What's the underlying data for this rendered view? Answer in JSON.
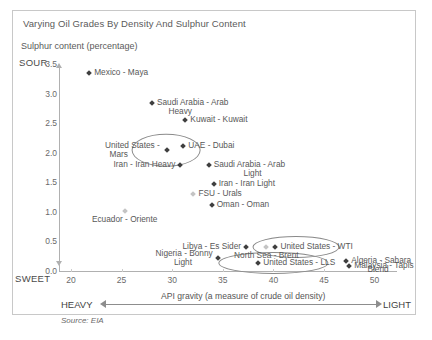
{
  "chart_data": {
    "type": "scatter",
    "title": "Varying Oil Grades By Density And Sulphur Content",
    "ylabel": "Sulphur content (percentage)",
    "xlabel": "API gravity (a measure of crude oil density)",
    "xlim": [
      20,
      50
    ],
    "ylim": [
      0.0,
      3.5
    ],
    "xticks": [
      "20",
      "25",
      "30",
      "35",
      "40",
      "45",
      "50"
    ],
    "yticks": [
      "0.0",
      "0.5",
      "1.0",
      "1.5",
      "2.0",
      "2.5",
      "3.0",
      "3.5"
    ],
    "grid": false,
    "legend": "none",
    "axis_end_labels": {
      "y_top": "SOUR",
      "y_bottom": "SWEET",
      "x_left": "HEAVY",
      "x_right": "LIGHT"
    },
    "source": "Source: EIA",
    "marker_color": "#3f3f3f",
    "highlight_color": "#8a8a8a",
    "points": [
      {
        "name": "Mexico - Maya",
        "x": 21.8,
        "y": 3.35,
        "label_pos": "right",
        "faint": false,
        "highlighted": false
      },
      {
        "name": "Saudi Arabia - Arab\n     Heavy",
        "x": 28.0,
        "y": 2.85,
        "label_pos": "right",
        "faint": false,
        "highlighted": false
      },
      {
        "name": "Kuwait - Kuwait",
        "x": 31.3,
        "y": 2.55,
        "label_pos": "right",
        "faint": false,
        "highlighted": false
      },
      {
        "name": "United States - \n  Mars",
        "x": 29.5,
        "y": 2.05,
        "label_pos": "left",
        "faint": false,
        "highlighted": true
      },
      {
        "name": "UAE - Dubai",
        "x": 31.1,
        "y": 2.12,
        "label_pos": "right",
        "faint": false,
        "highlighted": false
      },
      {
        "name": "Iran - Iran Heavy",
        "x": 30.8,
        "y": 1.8,
        "label_pos": "left",
        "faint": false,
        "highlighted": false
      },
      {
        "name": "Saudi Arabia - Arab\n             Light",
        "x": 33.6,
        "y": 1.8,
        "label_pos": "right",
        "faint": false,
        "highlighted": false
      },
      {
        "name": "Iran - Iran Light",
        "x": 34.1,
        "y": 1.47,
        "label_pos": "right",
        "faint": false,
        "highlighted": false
      },
      {
        "name": "FSU - Urals",
        "x": 32.1,
        "y": 1.31,
        "label_pos": "right",
        "faint": true,
        "highlighted": false
      },
      {
        "name": "Oman - Oman",
        "x": 33.9,
        "y": 1.12,
        "label_pos": "right",
        "faint": false,
        "highlighted": false
      },
      {
        "name": "Ecuador - Oriente",
        "x": 25.3,
        "y": 1.02,
        "label_pos": "center",
        "faint": true,
        "highlighted": false
      },
      {
        "name": "North Sea - Brent",
        "x": 39.3,
        "y": 0.4,
        "label_pos": "center",
        "faint": true,
        "highlighted": false
      },
      {
        "name": "Libya - Es Sider",
        "x": 37.3,
        "y": 0.4,
        "label_pos": "left",
        "faint": false,
        "highlighted": false
      },
      {
        "name": "United States - WTI",
        "x": 40.2,
        "y": 0.4,
        "label_pos": "right",
        "faint": false,
        "highlighted": true
      },
      {
        "name": "Nigeria - Bonny\n        Light",
        "x": 34.5,
        "y": 0.22,
        "label_pos": "left",
        "faint": false,
        "highlighted": false
      },
      {
        "name": "United States - LLS",
        "x": 38.5,
        "y": 0.13,
        "label_pos": "right",
        "faint": false,
        "highlighted": true
      },
      {
        "name": "Algeria - Sahara\n       Blend",
        "x": 47.2,
        "y": 0.17,
        "label_pos": "right",
        "faint": false,
        "highlighted": false
      },
      {
        "name": "Malaysia - Tapis",
        "x": 47.5,
        "y": 0.08,
        "label_pos": "right",
        "faint": false,
        "highlighted": false
      }
    ],
    "highlight_ellipses": [
      {
        "label": "United States - Mars",
        "cx": 29.4,
        "cy": 2.05,
        "rx": 3.3,
        "ry": 0.26
      },
      {
        "label": "United States - WTI",
        "cx": 42.2,
        "cy": 0.4,
        "rx": 4.2,
        "ry": 0.17
      },
      {
        "label": "United States - LLS",
        "cx": 40.0,
        "cy": 0.13,
        "rx": 5.3,
        "ry": 0.17
      }
    ]
  }
}
